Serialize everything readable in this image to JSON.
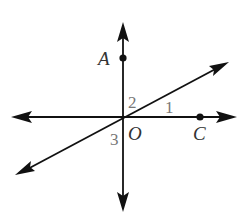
{
  "figure": {
    "colors": {
      "line": "#111111",
      "letter_label": "#333333",
      "number_label": "#777777",
      "background": "#ffffff"
    },
    "intersection": {
      "label": "O",
      "x": 123,
      "y": 117
    },
    "lines": [
      {
        "name": "vertical-line",
        "x1": 123,
        "y1": 24,
        "x2": 123,
        "y2": 211,
        "arrows": "both"
      },
      {
        "name": "horizontal-line",
        "x1": 12,
        "y1": 117,
        "x2": 236,
        "y2": 117,
        "arrows": "both"
      },
      {
        "name": "diagonal-line",
        "x1": 16,
        "y1": 175,
        "x2": 229,
        "y2": 62,
        "arrows": "both"
      }
    ],
    "points": [
      {
        "name": "A",
        "x": 123,
        "y": 58
      },
      {
        "name": "C",
        "x": 200,
        "y": 117
      }
    ],
    "labels": {
      "A": "A",
      "C": "C",
      "O": "O",
      "angle1": "1",
      "angle2": "2",
      "angle3": "3"
    }
  }
}
